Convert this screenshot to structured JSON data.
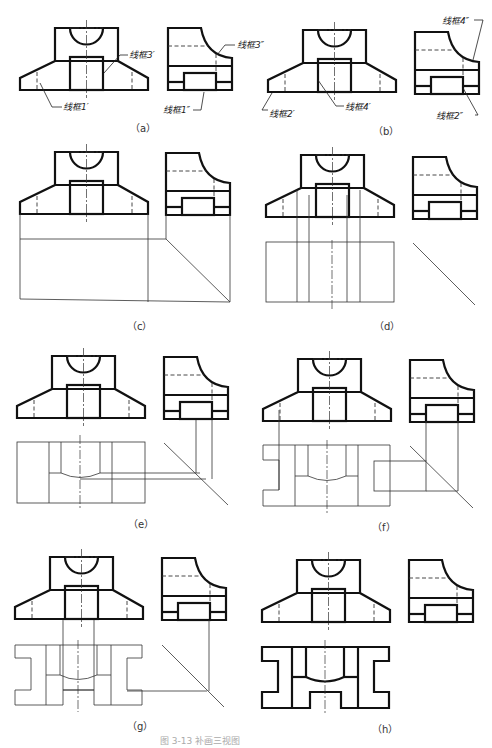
{
  "panels": [
    {
      "id": "a",
      "caption": "（a）"
    },
    {
      "id": "b",
      "caption": "（b）"
    },
    {
      "id": "c",
      "caption": "（c）"
    },
    {
      "id": "d",
      "caption": "（d）"
    },
    {
      "id": "e",
      "caption": "（e）"
    },
    {
      "id": "f",
      "caption": "（f）"
    },
    {
      "id": "g",
      "caption": "（g）"
    },
    {
      "id": "h",
      "caption": "（h）"
    }
  ],
  "labels": {
    "a_front_1": "线框1′",
    "a_front_3": "线框3′",
    "a_side_3": "线框3″",
    "a_side_1": "线框1″",
    "b_front_2": "线框2′",
    "b_front_4": "线框4′",
    "b_side_4": "线框4″",
    "b_side_2": "线框2″"
  },
  "figure_caption": "图 3-13  补画三视图"
}
